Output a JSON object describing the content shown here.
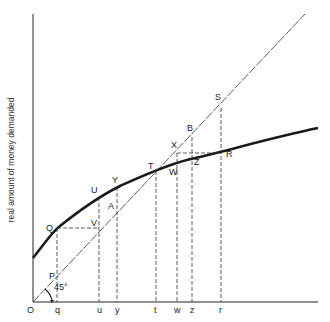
{
  "diagram": {
    "y_axis_label": "real amount of money demanded",
    "origin_label": "O",
    "angle_label": "45°",
    "colors": {
      "ink": "#222222",
      "curve": "#1a1a1a",
      "background": "#ffffff"
    },
    "x_ticks": [
      {
        "label": "q",
        "x": 57
      },
      {
        "label": "u",
        "x": 99
      },
      {
        "label": "y",
        "x": 117
      },
      {
        "label": "t",
        "x": 156
      },
      {
        "label": "w",
        "x": 177
      },
      {
        "label": "z",
        "x": 192
      },
      {
        "label": "r",
        "x": 221
      }
    ],
    "points": [
      {
        "label": "Q",
        "x": 57,
        "y": 228,
        "lx": 46,
        "ly": 226
      },
      {
        "label": "P",
        "x": 57,
        "y": 278,
        "lx": 48,
        "ly": 277
      },
      {
        "label": "U",
        "x": 99,
        "y": 197,
        "lx": 91,
        "ly": 192
      },
      {
        "label": "V",
        "x": 99,
        "y": 228,
        "lx": 91,
        "ly": 225
      },
      {
        "label": "Y",
        "x": 117,
        "y": 187,
        "lx": 112,
        "ly": 182
      },
      {
        "label": "A",
        "x": 117,
        "y": 207,
        "lx": 108,
        "ly": 208
      },
      {
        "label": "T",
        "x": 156,
        "y": 171,
        "lx": 148,
        "ly": 168
      },
      {
        "label": "W",
        "x": 177,
        "y": 163,
        "lx": 169,
        "ly": 174
      },
      {
        "label": "X",
        "x": 177,
        "y": 153,
        "lx": 170,
        "ly": 148
      },
      {
        "label": "B",
        "x": 192,
        "y": 137,
        "lx": 187,
        "ly": 131
      },
      {
        "label": "Z",
        "x": 192,
        "y": 160,
        "lx": 194,
        "ly": 165
      },
      {
        "label": "S",
        "x": 221,
        "y": 108,
        "lx": 215,
        "ly": 100
      },
      {
        "label": "R",
        "x": 221,
        "y": 153,
        "lx": 225,
        "ly": 157
      }
    ]
  }
}
